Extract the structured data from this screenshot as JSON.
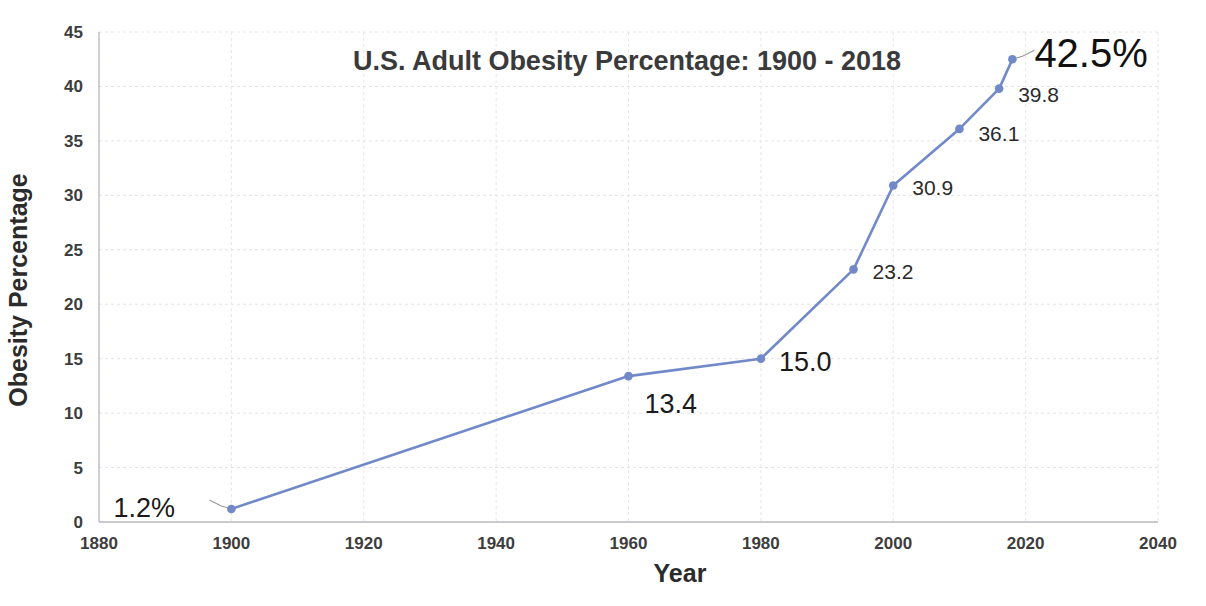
{
  "chart_data": {
    "type": "line",
    "title": "U.S. Adult Obesity Percentage: 1900 - 2018",
    "xlabel": "Year",
    "ylabel": "Obesity Percentage",
    "xlim": [
      1880,
      2040
    ],
    "ylim": [
      0,
      45
    ],
    "xticks": [
      "1880",
      "1900",
      "1920",
      "1940",
      "1960",
      "1980",
      "2000",
      "2020",
      "2040"
    ],
    "yticks": [
      "0",
      "5",
      "10",
      "15",
      "20",
      "25",
      "30",
      "35",
      "40",
      "45"
    ],
    "grid": true,
    "legend": "none",
    "series": [
      {
        "name": "U.S. Adult Obesity Percentage",
        "color": "#7189c9",
        "x": [
          1900,
          1960,
          1980,
          1994,
          2000,
          2010,
          2016,
          2018
        ],
        "values": [
          1.2,
          13.4,
          15.0,
          23.2,
          30.9,
          36.1,
          39.8,
          42.5
        ]
      }
    ],
    "point_labels": [
      {
        "text": "1.2%",
        "x": 1900,
        "y": 1.2,
        "size": "big",
        "leader": true
      },
      {
        "text": "13.4",
        "x": 1960,
        "y": 13.4,
        "size": "big",
        "leader": false
      },
      {
        "text": "15.0",
        "x": 1980,
        "y": 15.0,
        "size": "big",
        "leader": false
      },
      {
        "text": "23.2",
        "x": 1994,
        "y": 23.2,
        "size": "normal",
        "leader": false
      },
      {
        "text": "30.9",
        "x": 2000,
        "y": 30.9,
        "size": "normal",
        "leader": false
      },
      {
        "text": "36.1",
        "x": 2010,
        "y": 36.1,
        "size": "normal",
        "leader": false
      },
      {
        "text": "39.8",
        "x": 2016,
        "y": 39.8,
        "size": "normal",
        "leader": false
      },
      {
        "text": "42.5%",
        "x": 2018,
        "y": 42.5,
        "size": "huge",
        "leader": true
      }
    ]
  },
  "footnote": {
    "text": ""
  }
}
